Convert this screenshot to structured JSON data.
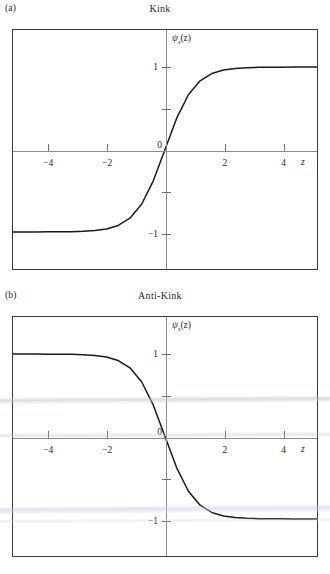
{
  "figure": {
    "background": "#ffffff",
    "frame_color": "#3a3a3a",
    "axis_color": "#8d8d8d",
    "curve_color": "#1a1a1a"
  },
  "panels": [
    {
      "label": "(a)",
      "title": "Kink",
      "ylabel_symbol": "ψ",
      "ylabel_sub": "s",
      "ylabel_arg": "(z)",
      "xaxis_name": "z"
    },
    {
      "label": "(b)",
      "title": "Anti-Kink",
      "ylabel_symbol": "ψ",
      "ylabel_sub": "s",
      "ylabel_arg": "(z)",
      "xaxis_name": "z"
    }
  ],
  "chart_data": [
    {
      "type": "line",
      "title": "Kink",
      "panel_label": "(a)",
      "xlabel": "z",
      "ylabel": "ψ_s(z)",
      "xlim": [
        -5.2,
        5.2
      ],
      "ylim": [
        -1.45,
        1.45
      ],
      "grid": false,
      "legend": null,
      "xticks": [
        -4,
        -2,
        2,
        4
      ],
      "xticklabels": [
        "−4",
        "−2",
        "2",
        "4"
      ],
      "yticks": [
        -1,
        -0.5,
        0,
        0.5,
        1
      ],
      "yticklabels": [
        "−1",
        "",
        "0",
        "",
        "1"
      ],
      "series": [
        {
          "name": "kink",
          "expression": "tanh(z)",
          "x": [
            -5.2,
            -4.8,
            -4.4,
            -4.0,
            -3.6,
            -3.2,
            -2.8,
            -2.4,
            -2.0,
            -1.6,
            -1.2,
            -0.8,
            -0.4,
            0.0,
            0.4,
            0.8,
            1.2,
            1.6,
            2.0,
            2.4,
            2.8,
            3.2,
            3.6,
            4.0,
            4.4,
            4.8,
            5.2
          ],
          "y": [
            -0.9999,
            -0.9999,
            -0.9997,
            -0.9993,
            -0.9985,
            -0.9967,
            -0.9926,
            -0.9837,
            -0.964,
            -0.9217,
            -0.8337,
            -0.664,
            -0.3799,
            0.0,
            0.3799,
            0.664,
            0.8337,
            0.9217,
            0.964,
            0.9837,
            0.9926,
            0.9967,
            0.9985,
            0.9993,
            0.9997,
            0.9999,
            0.9999
          ]
        }
      ]
    },
    {
      "type": "line",
      "title": "Anti-Kink",
      "panel_label": "(b)",
      "xlabel": "z",
      "ylabel": "ψ_s(z)",
      "xlim": [
        -5.2,
        5.2
      ],
      "ylim": [
        -1.45,
        1.45
      ],
      "grid": false,
      "legend": null,
      "xticks": [
        -4,
        -2,
        2,
        4
      ],
      "xticklabels": [
        "−4",
        "−2",
        "2",
        "4"
      ],
      "yticks": [
        -1,
        -0.5,
        0,
        0.5,
        1
      ],
      "yticklabels": [
        "−1",
        "",
        "0",
        "",
        "1"
      ],
      "series": [
        {
          "name": "anti-kink",
          "expression": "-tanh(z)",
          "x": [
            -5.2,
            -4.8,
            -4.4,
            -4.0,
            -3.6,
            -3.2,
            -2.8,
            -2.4,
            -2.0,
            -1.6,
            -1.2,
            -0.8,
            -0.4,
            0.0,
            0.4,
            0.8,
            1.2,
            1.6,
            2.0,
            2.4,
            2.8,
            3.2,
            3.6,
            4.0,
            4.4,
            4.8,
            5.2
          ],
          "y": [
            0.9999,
            0.9999,
            0.9997,
            0.9993,
            0.9985,
            0.9967,
            0.9926,
            0.9837,
            0.964,
            0.9217,
            0.8337,
            0.664,
            0.3799,
            0.0,
            -0.3799,
            -0.664,
            -0.8337,
            -0.9217,
            -0.964,
            -0.9837,
            -0.9926,
            -0.9967,
            -0.9985,
            -0.9993,
            -0.9997,
            -0.9999,
            -0.9999
          ]
        }
      ]
    }
  ]
}
